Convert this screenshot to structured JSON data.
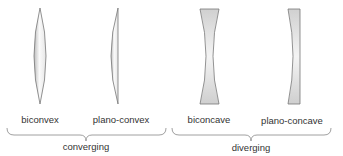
{
  "diagram": {
    "title": "",
    "colors": {
      "lens_fill_light": "#f7f7f7",
      "lens_fill_dark": "#c8c8c8",
      "lens_stroke": "#777777",
      "brace": "#888888",
      "text": "#333333"
    },
    "lenses": [
      {
        "id": "biconvex",
        "label": "biconvex",
        "group": "converging"
      },
      {
        "id": "plano-convex",
        "label": "plano-convex",
        "group": "converging"
      },
      {
        "id": "biconcave",
        "label": "biconcave",
        "group": "diverging"
      },
      {
        "id": "plano-concave",
        "label": "plano-concave",
        "group": "diverging"
      }
    ],
    "groups": [
      {
        "id": "converging",
        "label": "converging"
      },
      {
        "id": "diverging",
        "label": "diverging"
      }
    ]
  }
}
